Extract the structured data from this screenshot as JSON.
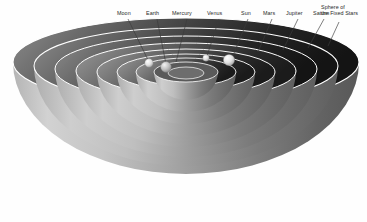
{
  "figure": {
    "background_color": "#fefefe",
    "style": "grayscale cutaway hemispherical shells"
  },
  "palette": {
    "background": "#fefefe",
    "shell_light": "#c9c9c9",
    "shell_mid": "#9a9a9a",
    "shell_dark": "#6e6e6e",
    "interior_dark": "#2b2b2b",
    "interior_darkest": "#151515",
    "rim_highlight": "#ffffff",
    "label_text": "#2a2a2a",
    "leader_line": "#3a3a3a",
    "sphere_body": "#e8e8e8"
  },
  "labels": [
    {
      "id": "moon",
      "text": "Moon",
      "x": 117,
      "y": 12,
      "anchor_x": 128,
      "anchor_y": 19,
      "tip_x": 149,
      "tip_y": 63
    },
    {
      "id": "earth",
      "text": "Earth",
      "x": 146,
      "y": 12,
      "anchor_x": 157,
      "anchor_y": 19,
      "tip_x": 165,
      "tip_y": 66
    },
    {
      "id": "mercury",
      "text": "Mercury",
      "x": 172,
      "y": 12,
      "anchor_x": 187,
      "anchor_y": 19,
      "tip_x": 172,
      "tip_y": 63
    },
    {
      "id": "venus",
      "text": "Venus",
      "x": 207,
      "y": 12,
      "anchor_x": 219,
      "anchor_y": 19,
      "tip_x": 205,
      "tip_y": 58
    },
    {
      "id": "sun",
      "text": "Sun",
      "x": 240,
      "y": 12,
      "anchor_x": 248,
      "anchor_y": 19,
      "tip_x": 229,
      "tip_y": 60
    },
    {
      "id": "mars",
      "text": "Mars",
      "x": 263,
      "y": 12,
      "anchor_x": 272,
      "anchor_y": 19,
      "tip_x": 258,
      "tip_y": 54
    },
    {
      "id": "jupiter",
      "text": "Jupiter",
      "x": 286,
      "y": 12,
      "anchor_x": 298,
      "anchor_y": 19,
      "tip_x": 283,
      "tip_y": 52
    },
    {
      "id": "saturn",
      "text": "Saturn",
      "x": 313,
      "y": 12,
      "anchor_x": 324,
      "anchor_y": 19,
      "tip_x": 308,
      "tip_y": 50
    }
  ],
  "outer_label": {
    "id": "fixed-stars",
    "line1": "Sphere of",
    "line2": "the Fixed Stars",
    "x": 320,
    "y": 5,
    "anchor_x": 330,
    "anchor_y": 20,
    "tip_x": 330,
    "tip_y": 48
  },
  "bodies": [
    {
      "id": "moon-sphere",
      "name": "Moon",
      "cx": 149,
      "cy": 63,
      "r": 4.2
    },
    {
      "id": "earth-sphere",
      "name": "Earth",
      "cx": 166,
      "cy": 67,
      "r": 5.2
    },
    {
      "id": "venus-sphere",
      "name": "Venus",
      "cx": 206,
      "cy": 58,
      "r": 3.4
    },
    {
      "id": "sun-sphere",
      "name": "Sun",
      "cx": 229,
      "cy": 60,
      "r": 5.6
    }
  ],
  "shells": [
    {
      "id": "shell-fixed-stars",
      "name": "Sphere of the Fixed Stars",
      "rx": 173,
      "ry": 44,
      "depth": 120
    },
    {
      "id": "shell-saturn",
      "name": "Saturn",
      "rx": 152,
      "ry": 38,
      "depth": 105
    },
    {
      "id": "shell-jupiter",
      "name": "Jupiter",
      "rx": 131,
      "ry": 33,
      "depth": 91
    },
    {
      "id": "shell-mars",
      "name": "Mars",
      "rx": 110,
      "ry": 28,
      "depth": 77
    },
    {
      "id": "shell-sun",
      "name": "Sun",
      "rx": 89,
      "ry": 23,
      "depth": 63
    },
    {
      "id": "shell-venus",
      "name": "Venus",
      "rx": 69,
      "ry": 18,
      "depth": 50
    },
    {
      "id": "shell-mercury",
      "name": "Mercury",
      "rx": 50,
      "ry": 14,
      "depth": 37
    },
    {
      "id": "shell-moon",
      "name": "Moon",
      "rx": 32,
      "ry": 10,
      "depth": 25
    }
  ],
  "geometry": {
    "center_x": 186,
    "rim_y": 62
  }
}
